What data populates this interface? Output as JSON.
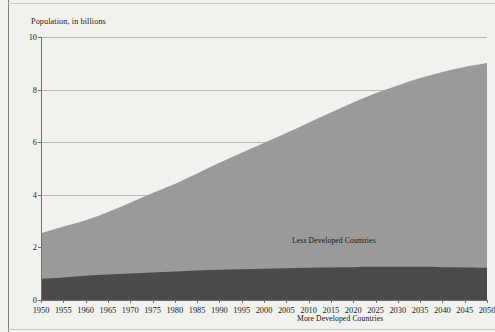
{
  "chart_data": {
    "type": "area",
    "title": "",
    "ylabel": "Population, in billions",
    "xlabel": "",
    "ylim": [
      0,
      10
    ],
    "xlim": [
      1950,
      2050
    ],
    "grid": true,
    "stacked": true,
    "legend_position": "inline-annotation",
    "ytick_labels": [
      "10",
      "8",
      "6",
      "4",
      "2",
      "0"
    ],
    "ytick_values": [
      10,
      8,
      6,
      4,
      2,
      0
    ],
    "xtick_labels": [
      "1950",
      "1955",
      "1960",
      "1965",
      "1970",
      "1975",
      "1980",
      "1985",
      "1990",
      "1995",
      "2000",
      "2005",
      "2010",
      "2015",
      "2020",
      "2025",
      "2030",
      "2035",
      "2040",
      "2045",
      "2050"
    ],
    "x": [
      1950,
      1955,
      1960,
      1965,
      1970,
      1975,
      1980,
      1985,
      1990,
      1995,
      2000,
      2005,
      2010,
      2015,
      2020,
      2025,
      2030,
      2035,
      2040,
      2045,
      2050
    ],
    "series": [
      {
        "name": "More Developed Countries",
        "color": "#4b4b4b",
        "values": [
          0.81,
          0.86,
          0.92,
          0.97,
          1.01,
          1.05,
          1.08,
          1.12,
          1.15,
          1.17,
          1.19,
          1.21,
          1.23,
          1.24,
          1.25,
          1.26,
          1.26,
          1.26,
          1.25,
          1.24,
          1.23
        ]
      },
      {
        "name": "Less Developed Countries",
        "color": "#9b9b9b",
        "values": [
          1.72,
          1.93,
          2.11,
          2.38,
          2.69,
          3.02,
          3.33,
          3.69,
          4.07,
          4.43,
          4.78,
          5.14,
          5.51,
          5.89,
          6.26,
          6.6,
          6.9,
          7.18,
          7.42,
          7.62,
          7.78
        ]
      }
    ],
    "totals": [
      2.53,
      2.79,
      3.03,
      3.35,
      3.7,
      4.07,
      4.41,
      4.81,
      5.22,
      5.6,
      5.97,
      6.35,
      6.74,
      7.13,
      7.51,
      7.86,
      8.16,
      8.44,
      8.67,
      8.86,
      9.01
    ],
    "annotations": [
      {
        "name": "less-developed-label",
        "text": "Less Developed Countries"
      },
      {
        "name": "more-developed-label",
        "text": "More Developed Countries"
      }
    ]
  }
}
